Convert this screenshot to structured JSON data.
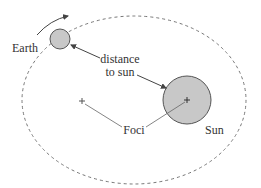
{
  "diagram": {
    "labels": {
      "earth": "Earth",
      "distance_line1": "distance",
      "distance_line2": "to sun",
      "foci": "Foci",
      "sun": "Sun"
    },
    "elements": {
      "orbit": {
        "shape": "dashed-ellipse",
        "cx": 134,
        "cy": 100,
        "rx": 112,
        "ry": 84
      },
      "earth": {
        "shape": "circle",
        "cx": 60,
        "cy": 39,
        "r": 10
      },
      "sun": {
        "shape": "circle",
        "cx": 187,
        "cy": 100,
        "r": 24
      },
      "focus_left": {
        "shape": "plus-marker",
        "x": 82,
        "y": 101
      },
      "focus_right": {
        "shape": "plus-marker",
        "x": 187,
        "y": 100
      },
      "motion_arrow": {
        "shape": "curved-arrow",
        "direction": "counterclockwise-up"
      }
    },
    "colors": {
      "body_fill": "#c8c8c8",
      "stroke": "#555555",
      "orbit_stroke": "#777777",
      "text": "#333333"
    }
  }
}
